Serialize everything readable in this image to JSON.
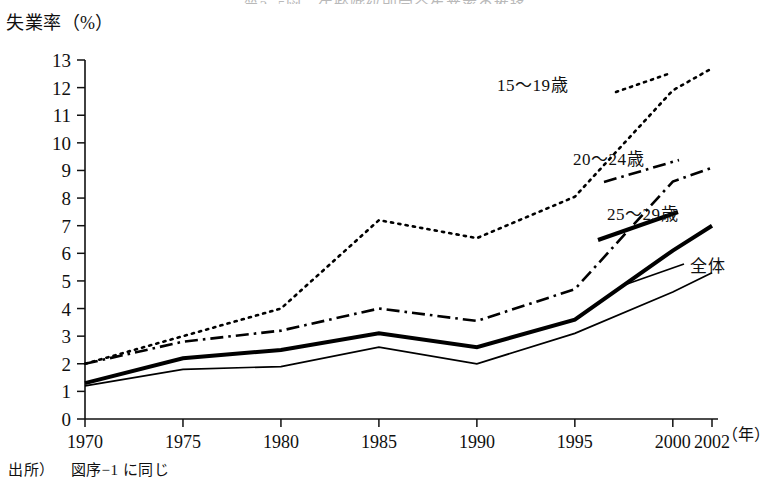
{
  "figure": {
    "title_cut": "第2−5図　年齢階級別完全失業率の推移",
    "y_axis_caption": "失業率（%）",
    "x_axis_caption": "（年）",
    "footnote_source_label": "出所）",
    "footnote_text": "図序−1 に同じ"
  },
  "chart_data": {
    "type": "line",
    "title": "",
    "xlabel": "（年）",
    "ylabel": "失業率（%）",
    "x": [
      1970,
      1975,
      1980,
      1985,
      1990,
      1995,
      2000,
      2002
    ],
    "categories": [
      "1970",
      "1975",
      "1980",
      "1985",
      "1990",
      "1995",
      "2000",
      "2002"
    ],
    "xlim": [
      1970,
      2002
    ],
    "ylim": [
      0,
      13
    ],
    "yticks": [
      0,
      1,
      2,
      3,
      4,
      5,
      6,
      7,
      8,
      9,
      10,
      11,
      12,
      13
    ],
    "ytick_labels": [
      "0",
      "1",
      "2",
      "3",
      "4",
      "5",
      "6",
      "7",
      "8",
      "9",
      "10",
      "11",
      "12",
      "13"
    ],
    "grid": false,
    "legend_position": "inline-right",
    "series": [
      {
        "name": "15〜19歳",
        "style": "dotted",
        "color": "#000000",
        "values": [
          2.0,
          3.0,
          4.0,
          7.2,
          6.55,
          8.05,
          11.9,
          12.7
        ]
      },
      {
        "name": "20〜24歳",
        "style": "dash-dot",
        "color": "#000000",
        "values": [
          2.0,
          2.8,
          3.2,
          4.0,
          3.55,
          4.7,
          8.6,
          9.1
        ]
      },
      {
        "name": "25〜29歳",
        "style": "solid-thick",
        "color": "#000000",
        "values": [
          1.3,
          2.2,
          2.5,
          3.1,
          2.6,
          3.6,
          6.1,
          7.0
        ]
      },
      {
        "name": "全体",
        "style": "solid-thin",
        "color": "#000000",
        "values": [
          1.2,
          1.8,
          1.9,
          2.6,
          2.0,
          3.1,
          4.6,
          5.3
        ]
      }
    ]
  }
}
